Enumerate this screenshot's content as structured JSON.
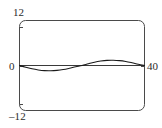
{
  "figure": {
    "name": "sine-wave-plot",
    "background_color": "#ffffff",
    "frame_color": "#4a4a4a",
    "curve_color": "#1a1a1a",
    "axis_color": "#3a3a3a",
    "text_color": "#2b2b2b"
  },
  "labels": {
    "y_max": "12",
    "y_zero": "0",
    "y_min": "–12",
    "x_max": "40"
  },
  "chart_data": {
    "type": "line",
    "title": "",
    "xlabel": "",
    "ylabel": "",
    "xlim": [
      0,
      40
    ],
    "ylim": [
      -12,
      12
    ],
    "grid": false,
    "legend": null,
    "xticks": [
      0,
      40
    ],
    "xticklabels": [
      "0",
      "40"
    ],
    "yticks": [
      -12,
      0,
      12
    ],
    "yticklabels": [
      "–12",
      "0",
      "12"
    ],
    "series": [
      {
        "name": "sine wave",
        "color": "#1a1a1a",
        "x": [
          0,
          2,
          4,
          6,
          8,
          10,
          12,
          14,
          16,
          18,
          20,
          22,
          24,
          26,
          28,
          30,
          32,
          34,
          36,
          38,
          40
        ],
        "y": [
          0,
          -0.46,
          -0.88,
          -1.18,
          -1.37,
          -1.4,
          -1.3,
          -1.07,
          -0.73,
          -0.34,
          0,
          0.46,
          0.88,
          1.18,
          1.37,
          1.4,
          1.3,
          1.07,
          0.73,
          0.34,
          0
        ]
      },
      {
        "name": "zero reference line",
        "color": "#3a3a3a",
        "x": [
          0,
          40
        ],
        "y": [
          0,
          0
        ]
      }
    ],
    "annotations": [
      "curve dips below zero over first half (minimum near x=10)",
      "curve rises above zero over second half (maximum near x=30)",
      "curve crosses zero at x=0, x=20 and x=40"
    ]
  }
}
